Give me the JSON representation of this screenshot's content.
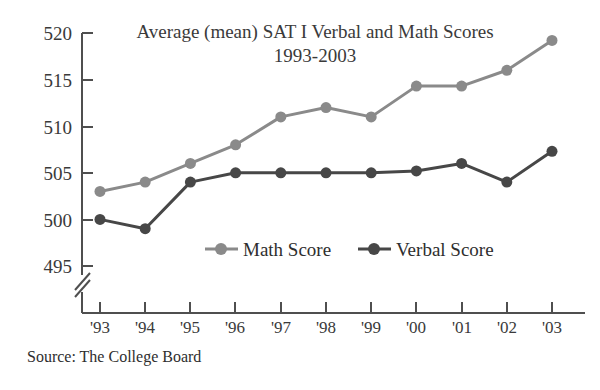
{
  "chart_data": {
    "type": "line",
    "title": "Average (mean) SAT I Verbal and Math Scores",
    "subtitle": "1993-2003",
    "xlabel": "",
    "ylabel": "",
    "categories": [
      "'93",
      "'94",
      "'95",
      "'96",
      "'97",
      "'98",
      "'99",
      "'00",
      "'01",
      "'02",
      "'03"
    ],
    "x": [
      1993,
      1994,
      1995,
      1996,
      1997,
      1998,
      1999,
      2000,
      2001,
      2002,
      2003
    ],
    "series": [
      {
        "name": "Math Score",
        "color": "#8a8a8a",
        "values": [
          503,
          504,
          506,
          508,
          511,
          512,
          511,
          514.3,
          514.3,
          516,
          519.2
        ]
      },
      {
        "name": "Verbal Score",
        "color": "#474747",
        "values": [
          500,
          499,
          504,
          505,
          505,
          505,
          505,
          505.2,
          506,
          504,
          507.3
        ]
      }
    ],
    "ylim": [
      495,
      520
    ],
    "yticks": [
      495,
      500,
      505,
      510,
      515,
      520
    ],
    "ytick_labels": [
      "495",
      "500",
      "505",
      "510",
      "515",
      "520"
    ],
    "y_axis_break": true,
    "grid": false,
    "legend_position": "inside-lower-center",
    "source": "Source: The College Board"
  },
  "legend": {
    "math_label": "Math Score",
    "verbal_label": "Verbal Score"
  },
  "colors": {
    "math": "#8a8a8a",
    "verbal": "#474747",
    "axis": "#4f4f4f",
    "text": "#3a3a3a",
    "background": "#ffffff"
  }
}
